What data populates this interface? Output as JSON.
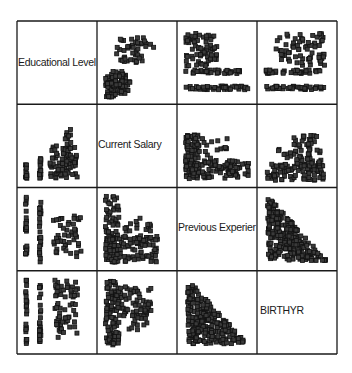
{
  "chart_data": {
    "type": "scatter",
    "subtype": "scatterplot-matrix",
    "title": "",
    "variables": [
      "Educational Level",
      "Current Salary",
      "Previous Experience",
      "BIRTHYR"
    ],
    "diagonal_labels": [
      "Educational Level",
      "Current Salary",
      "Previous Experier",
      "BIRTHYR"
    ],
    "grid": {
      "rows": 4,
      "cols": 4,
      "left": 17,
      "top": 21,
      "right": 337,
      "bottom": 354
    },
    "marker": "hollow-square",
    "colors": {
      "marker_fill": "#3a3a3a",
      "marker_edge": "#111111",
      "border": "#1a1a1a",
      "background": "#ffffff"
    },
    "panels": [
      {
        "row": 0,
        "col": 1,
        "x": "Current Salary",
        "y": "Educational Level",
        "pattern": "discrete-levels-y, salary rises with education",
        "clusters": [
          [
            0.05,
            0.62,
            0.35,
            0.3,
            70
          ],
          [
            0.05,
            0.78,
            0.25,
            0.06,
            12
          ],
          [
            0.05,
            0.92,
            0.15,
            0.05,
            10
          ],
          [
            0.2,
            0.15,
            0.4,
            0.35,
            40
          ],
          [
            0.55,
            0.2,
            0.3,
            0.1,
            6
          ]
        ]
      },
      {
        "row": 0,
        "col": 2,
        "x": "Previous Experience",
        "y": "Educational Level",
        "pattern": "horizontal bands",
        "clusters": [
          [
            0.05,
            0.1,
            0.45,
            0.45,
            70
          ],
          [
            0.05,
            0.6,
            0.8,
            0.05,
            40
          ],
          [
            0.05,
            0.82,
            0.95,
            0.05,
            45
          ]
        ]
      },
      {
        "row": 0,
        "col": 3,
        "x": "BIRTHYR",
        "y": "Educational Level",
        "pattern": "horizontal bands",
        "clusters": [
          [
            0.2,
            0.1,
            0.7,
            0.45,
            70
          ],
          [
            0.05,
            0.6,
            0.85,
            0.05,
            40
          ],
          [
            0.05,
            0.82,
            0.85,
            0.05,
            40
          ]
        ]
      },
      {
        "row": 1,
        "col": 0,
        "x": "Educational Level",
        "y": "Current Salary",
        "pattern": "vertical columns at education levels",
        "clusters": [
          [
            0.05,
            0.75,
            0.02,
            0.2,
            12
          ],
          [
            0.25,
            0.65,
            0.02,
            0.3,
            16
          ],
          [
            0.4,
            0.5,
            0.4,
            0.45,
            80
          ],
          [
            0.6,
            0.25,
            0.1,
            0.35,
            14
          ]
        ]
      },
      {
        "row": 1,
        "col": 2,
        "x": "Previous Experience",
        "y": "Current Salary",
        "pattern": "L-shaped decreasing",
        "clusters": [
          [
            0.05,
            0.35,
            0.2,
            0.6,
            90
          ],
          [
            0.05,
            0.7,
            0.9,
            0.25,
            90
          ],
          [
            0.25,
            0.4,
            0.4,
            0.4,
            20
          ]
        ]
      },
      {
        "row": 1,
        "col": 3,
        "x": "BIRTHYR",
        "y": "Current Salary",
        "pattern": "increasing toward recent years",
        "clusters": [
          [
            0.05,
            0.75,
            0.85,
            0.22,
            90
          ],
          [
            0.45,
            0.35,
            0.4,
            0.45,
            60
          ],
          [
            0.2,
            0.5,
            0.25,
            0.2,
            8
          ]
        ]
      },
      {
        "row": 2,
        "col": 0,
        "x": "Educational Level",
        "y": "Previous Experience",
        "pattern": "vertical columns",
        "clusters": [
          [
            0.05,
            0.05,
            0.02,
            0.9,
            25
          ],
          [
            0.25,
            0.05,
            0.02,
            0.9,
            25
          ],
          [
            0.45,
            0.3,
            0.4,
            0.6,
            50
          ]
        ]
      },
      {
        "row": 2,
        "col": 1,
        "x": "Current Salary",
        "y": "Previous Experience",
        "pattern": "L-shaped decreasing",
        "clusters": [
          [
            0.05,
            0.05,
            0.2,
            0.9,
            90
          ],
          [
            0.05,
            0.6,
            0.75,
            0.35,
            80
          ],
          [
            0.3,
            0.35,
            0.4,
            0.35,
            25
          ]
        ]
      },
      {
        "row": 2,
        "col": 3,
        "x": "BIRTHYR",
        "y": "Previous Experience",
        "pattern": "triangle, negative",
        "triangle": true
      },
      {
        "row": 3,
        "col": 0,
        "x": "Educational Level",
        "y": "BIRTHYR",
        "pattern": "vertical columns",
        "clusters": [
          [
            0.05,
            0.05,
            0.02,
            0.9,
            25
          ],
          [
            0.25,
            0.05,
            0.02,
            0.9,
            25
          ],
          [
            0.45,
            0.05,
            0.35,
            0.65,
            60
          ],
          [
            0.5,
            0.7,
            0.3,
            0.15,
            8
          ]
        ]
      },
      {
        "row": 3,
        "col": 1,
        "x": "Current Salary",
        "y": "BIRTHYR",
        "pattern": "dense left, spreading right",
        "clusters": [
          [
            0.05,
            0.05,
            0.2,
            0.9,
            100
          ],
          [
            0.2,
            0.15,
            0.5,
            0.4,
            60
          ],
          [
            0.35,
            0.45,
            0.3,
            0.3,
            20
          ]
        ]
      },
      {
        "row": 3,
        "col": 2,
        "x": "Previous Experience",
        "y": "BIRTHYR",
        "pattern": "triangle, negative",
        "triangle": true
      }
    ]
  }
}
